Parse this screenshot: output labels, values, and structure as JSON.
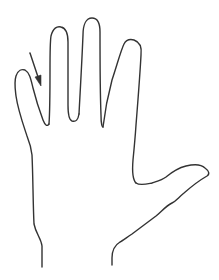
{
  "diagram": {
    "stroke_color": "#333333",
    "background": "#ffffff",
    "annotation": {
      "type": "arrow",
      "pointing_to": "gap between little finger and ring finger"
    }
  }
}
